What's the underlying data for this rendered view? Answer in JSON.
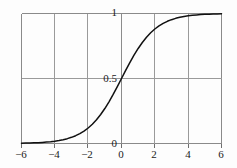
{
  "chart_data": {
    "type": "line",
    "title": "",
    "subtitle": "",
    "xlabel": "",
    "ylabel": "",
    "xlim": [
      -6,
      6
    ],
    "ylim": [
      0,
      1
    ],
    "grid": true,
    "legend": null,
    "x_ticks": [
      -6,
      -4,
      -2,
      0,
      2,
      4,
      6
    ],
    "x_tick_labels": [
      "−6",
      "−4",
      "−2",
      "0",
      "2",
      "4",
      "6"
    ],
    "y_ticks": [
      0,
      0.5,
      1
    ],
    "y_tick_labels": [
      "0",
      "0.5",
      "1"
    ],
    "gridlines_x": [
      -4,
      -2,
      0,
      2,
      4
    ],
    "gridlines_y": [
      0.5
    ],
    "series": [
      {
        "name": "logistic sigmoid",
        "color": "#111111",
        "x": [
          -6,
          -5.75,
          -5.5,
          -5.25,
          -5,
          -4.75,
          -4.5,
          -4.25,
          -4,
          -3.75,
          -3.5,
          -3.25,
          -3,
          -2.75,
          -2.5,
          -2.25,
          -2,
          -1.75,
          -1.5,
          -1.25,
          -1,
          -0.75,
          -0.5,
          -0.25,
          0,
          0.25,
          0.5,
          0.75,
          1,
          1.25,
          1.5,
          1.75,
          2,
          2.25,
          2.5,
          2.75,
          3,
          3.25,
          3.5,
          3.75,
          4,
          4.25,
          4.5,
          4.75,
          5,
          5.25,
          5.5,
          5.75,
          6
        ],
        "y": [
          0.0025,
          0.0032,
          0.0041,
          0.0052,
          0.0067,
          0.0086,
          0.011,
          0.014,
          0.018,
          0.0231,
          0.0293,
          0.0373,
          0.0474,
          0.0601,
          0.0759,
          0.0952,
          0.1192,
          0.148,
          0.1824,
          0.2227,
          0.2689,
          0.3208,
          0.3775,
          0.4378,
          0.5,
          0.5622,
          0.6225,
          0.6792,
          0.7311,
          0.7773,
          0.8176,
          0.852,
          0.8808,
          0.9048,
          0.9241,
          0.9399,
          0.9526,
          0.9627,
          0.9707,
          0.9769,
          0.982,
          0.986,
          0.989,
          0.9914,
          0.9933,
          0.9948,
          0.9959,
          0.9968,
          0.9975
        ]
      }
    ],
    "annotations": []
  },
  "axis": {
    "x_labels": [
      {
        "text": "−6",
        "value": -6
      },
      {
        "text": "−4",
        "value": -4
      },
      {
        "text": "−2",
        "value": -2
      },
      {
        "text": "0",
        "value": 0
      },
      {
        "text": "2",
        "value": 2
      },
      {
        "text": "4",
        "value": 4
      },
      {
        "text": "6",
        "value": 6
      }
    ],
    "y_labels": [
      {
        "text": "1",
        "value": 1
      },
      {
        "text": "0.5",
        "value": 0.5
      },
      {
        "text": "0",
        "value": 0
      }
    ]
  },
  "style": {
    "background": "#fdfdfd",
    "curve_color": "#111111",
    "grid_color": "#9a9a9a",
    "frame_color": "#8a8a8a",
    "text_color": "#1a1a1a"
  }
}
